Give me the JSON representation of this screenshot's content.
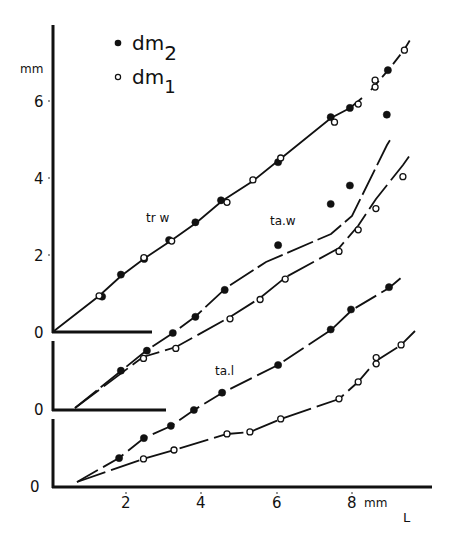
{
  "chart_data": {
    "type": "scatter",
    "title": "",
    "xlabel": "L",
    "x_unit": "mm",
    "ylabel": "mm",
    "xlim": [
      0,
      10
    ],
    "x_ticks": [
      2,
      4,
      6,
      8
    ],
    "y_ticks_top_panel": [
      0,
      2,
      4,
      6
    ],
    "legend": [
      {
        "label": "dm",
        "subscript": "2",
        "marker": "filled-circle"
      },
      {
        "label": "dm",
        "subscript": "1",
        "marker": "open-circle"
      }
    ],
    "panels": [
      {
        "name": "tr w",
        "baseline_label": "0",
        "series": [
          {
            "name": "dm2",
            "marker": "filled",
            "x": [
              1.36,
              1.86,
              2.48,
              3.14,
              3.84,
              4.52,
              6.04,
              7.44,
              7.95,
              8.96
            ],
            "y": [
              0.92,
              1.49,
              1.9,
              2.39,
              2.85,
              3.42,
              4.41,
              5.58,
              5.82,
              6.8
            ]
          },
          {
            "name": "dm1",
            "marker": "open",
            "x": [
              1.28,
              2.47,
              3.21,
              4.68,
              5.37,
              6.11,
              7.54,
              8.17,
              8.62,
              8.62,
              9.4
            ],
            "y": [
              0.94,
              1.93,
              2.36,
              3.37,
              3.95,
              4.52,
              5.45,
              5.92,
              6.36,
              6.54,
              7.32
            ]
          }
        ],
        "fit": "near-linear from origin, slight upward curvature after 7.5"
      },
      {
        "name": "ta.w",
        "baseline_label": "0",
        "origin_x": 0.64,
        "series": [
          {
            "name": "dm2",
            "marker": "filled",
            "x": [
              1.86,
              2.55,
              3.24,
              3.84,
              4.62,
              6.04,
              7.44,
              7.95,
              8.93
            ],
            "y": [
              1.02,
              1.54,
              2.0,
              2.42,
              3.12,
              4.28,
              5.35,
              5.83,
              7.67
            ]
          },
          {
            "name": "dm1",
            "marker": "open",
            "x": [
              2.46,
              3.32,
              4.76,
              5.56,
              6.23,
              7.66,
              8.17,
              8.64,
              9.36
            ],
            "y": [
              1.34,
              1.6,
              2.37,
              2.87,
              3.4,
              4.12,
              4.68,
              5.23,
              6.06
            ]
          }
        ]
      },
      {
        "name": "ta.l",
        "baseline_label": "0",
        "origin_x": 0.69,
        "series": [
          {
            "name": "dm2",
            "marker": "filled",
            "x": [
              1.81,
              2.47,
              3.19,
              3.8,
              4.55,
              6.04,
              7.44,
              7.98,
              8.99
            ],
            "y": [
              0.75,
              1.27,
              1.59,
              2.0,
              2.45,
              3.17,
              4.09,
              4.61,
              5.19
            ]
          },
          {
            "name": "dm1",
            "marker": "open",
            "x": [
              2.46,
              3.27,
              4.68,
              5.29,
              6.11,
              7.66,
              8.17,
              8.65,
              8.65,
              9.31
            ],
            "y": [
              0.73,
              0.96,
              1.38,
              1.43,
              1.77,
              2.29,
              2.73,
              3.2,
              3.36,
              3.69
            ]
          }
        ]
      }
    ],
    "annotations": [
      "tr w",
      "ta.w",
      "ta.l"
    ]
  },
  "labels": {
    "y_unit": "mm",
    "x_unit": "mm",
    "x_axis_name": "L",
    "legend_dm2": "dm",
    "legend_dm2_sub": "2",
    "legend_dm1": "dm",
    "legend_dm1_sub": "1",
    "panel_top": "tr w",
    "panel_mid": "ta.w",
    "panel_bot": "ta.l",
    "zero": "0",
    "yt6": "6",
    "yt4": "4",
    "yt2": "2",
    "xt2": "2",
    "xt4": "4",
    "xt6": "6",
    "xt8": "8"
  }
}
